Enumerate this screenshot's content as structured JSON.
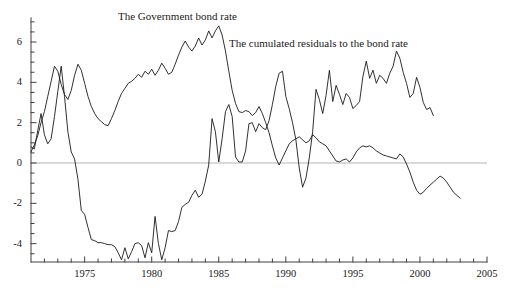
{
  "figure": {
    "title": "",
    "background_color": "#ffffff",
    "line_color": "#1a1a1a",
    "zero_line_color": "#b4b4b4",
    "axis_color": "#404040"
  },
  "annotations": {
    "bond_rate_label": "The Government bond rate",
    "residuals_label": "The cumulated residuals to the bond rate"
  },
  "chart_data": {
    "type": "line",
    "title": "",
    "subtitle": "",
    "xlabel": "",
    "ylabel": "",
    "xlim": [
      1971.0,
      2005.0
    ],
    "ylim": [
      -4.9,
      7.2
    ],
    "grid": false,
    "legend_position": "inline-annotations",
    "x_ticks_major": [
      1975,
      1980,
      1985,
      1990,
      1995,
      2000,
      2005
    ],
    "x_tick_labels": [
      "1975",
      "1980",
      "1985",
      "1990",
      "1995",
      "2000",
      "2005"
    ],
    "x_tick_minor_step": 1,
    "y_ticks_major": [
      -4,
      -2,
      0,
      2,
      4,
      6
    ],
    "y_tick_labels": [
      "-4",
      "-2",
      "0",
      "2",
      "4",
      "6"
    ],
    "y_tick_minor_step": 0.5,
    "zero_reference_line": 0,
    "series": [
      {
        "name": "The Government bond rate",
        "x_start": 1971.0,
        "x_end": 2001.1,
        "x_step": 0.25,
        "values": [
          0.8,
          0.7,
          1.6,
          2.45,
          1.4,
          0.95,
          1.2,
          2.3,
          3.55,
          4.8,
          3.3,
          1.55,
          0.55,
          0.2,
          -0.8,
          -2.35,
          -2.55,
          -3.2,
          -3.8,
          -3.85,
          -3.95,
          -3.95,
          -4.0,
          -4.05,
          -4.05,
          -4.15,
          -4.45,
          -4.8,
          -4.2,
          -4.75,
          -4.4,
          -4.0,
          -3.95,
          -4.1,
          -4.7,
          -3.95,
          -4.45,
          -2.65,
          -4.0,
          -4.8,
          -4.2,
          -3.35,
          -3.4,
          -3.35,
          -2.9,
          -2.2,
          -2.05,
          -1.95,
          -1.6,
          -1.35,
          -1.7,
          -1.55,
          -0.9,
          -0.1,
          2.2,
          1.55,
          0.05,
          1.2,
          2.55,
          2.9,
          2.3,
          0.3,
          0.05,
          0.05,
          0.6,
          1.95,
          2.0,
          1.55,
          1.95,
          1.75,
          1.65,
          2.1,
          2.9,
          3.8,
          4.45,
          4.55,
          3.3,
          2.7,
          2.0,
          1.15,
          -0.25,
          -1.2,
          -0.75,
          0.25,
          1.55,
          3.65,
          3.15,
          2.45,
          3.35,
          4.6,
          3.05,
          3.85,
          3.4,
          2.9,
          3.45,
          3.25,
          2.7,
          2.85,
          3.05,
          4.3,
          5.05,
          4.2,
          4.6,
          3.95,
          4.35,
          4.2,
          3.95,
          4.45,
          4.8,
          5.55,
          5.2,
          4.5,
          3.95,
          3.25,
          3.45,
          4.25,
          3.75,
          3.0,
          2.65,
          2.75,
          2.35,
          2.2,
          1.95,
          1.65,
          1.2,
          0.85,
          0.6,
          0.4,
          0.05,
          -0.25,
          -0.55,
          0.2,
          -0.15,
          1.55,
          1.35,
          1.45,
          1.0,
          1.35,
          1.0,
          0.7,
          1.25,
          0.85,
          0.6,
          0.95,
          1.05,
          0.25,
          0.65,
          0.2
        ]
      },
      {
        "name": "The cumulated residuals to the bond rate",
        "x_start": 1971.0,
        "x_end": 2003.2,
        "x_step": 0.25,
        "values": [
          0.55,
          0.9,
          1.35,
          2.0,
          2.55,
          3.3,
          4.05,
          4.8,
          4.55,
          3.9,
          3.4,
          3.15,
          3.6,
          4.35,
          4.9,
          4.6,
          3.95,
          3.3,
          2.8,
          2.45,
          2.2,
          2.05,
          1.9,
          1.85,
          2.2,
          2.6,
          3.05,
          3.45,
          3.7,
          3.95,
          4.05,
          4.2,
          4.4,
          4.25,
          4.55,
          4.4,
          4.65,
          4.35,
          4.6,
          4.95,
          4.7,
          4.4,
          4.5,
          4.9,
          5.35,
          5.75,
          6.05,
          5.75,
          5.55,
          5.8,
          6.2,
          5.85,
          6.1,
          6.55,
          6.2,
          6.55,
          6.8,
          6.35,
          5.55,
          4.55,
          3.6,
          2.95,
          2.55,
          2.5,
          2.6,
          2.55,
          2.35,
          2.5,
          2.8,
          2.45,
          2.0,
          1.5,
          0.85,
          0.25,
          -0.1,
          0.25,
          0.6,
          0.95,
          1.1,
          1.2,
          1.3,
          1.15,
          1.0,
          1.1,
          1.4,
          1.25,
          1.05,
          0.95,
          0.85,
          0.6,
          0.35,
          0.1,
          0.05,
          0.15,
          0.2,
          0.05,
          0.25,
          0.55,
          0.75,
          0.85,
          0.8,
          0.85,
          0.75,
          0.6,
          0.5,
          0.4,
          0.35,
          0.3,
          0.25,
          0.2,
          0.45,
          0.3,
          -0.05,
          -0.45,
          -0.95,
          -1.35,
          -1.55,
          -1.45,
          -1.25,
          -1.1,
          -0.95,
          -0.8,
          -0.65,
          -0.75,
          -0.95,
          -1.2,
          -1.45,
          -1.6,
          -1.75,
          -1.9,
          -2.0,
          -2.1,
          -2.25,
          -2.4,
          -2.55,
          -2.7,
          -2.85,
          -2.9,
          -2.8,
          -2.6,
          -2.35,
          -2.15,
          -2.1,
          -2.2,
          -2.35,
          -2.4,
          -2.45,
          -2.55,
          -2.75,
          -2.65,
          -2.8,
          -3.0,
          -3.1,
          -3.05,
          -3.2,
          -3.3,
          -3.35,
          -3.3
        ]
      }
    ]
  },
  "axis_geometry": {
    "plot_left_px": 31,
    "plot_right_px": 487,
    "plot_bottom_px": 262,
    "y_px_at_zero": 163,
    "y_px_at_six": 42,
    "x_px_at_1975": 87,
    "x_px_at_2005": 485
  }
}
